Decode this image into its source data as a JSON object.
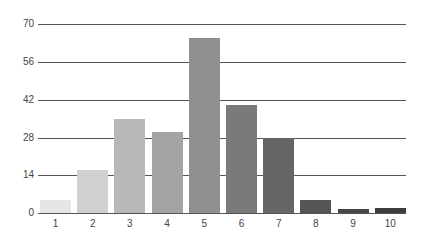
{
  "chart_data": {
    "type": "bar",
    "title": "",
    "xlabel": "",
    "ylabel": "",
    "categories": [
      "1",
      "2",
      "3",
      "4",
      "5",
      "6",
      "7",
      "8",
      "9",
      "10"
    ],
    "values": [
      5,
      16,
      35,
      30,
      65,
      40,
      28,
      5,
      1.5,
      2
    ],
    "colors": [
      "#e6e6e6",
      "#d0d0d0",
      "#b8b8b8",
      "#a3a3a3",
      "#8f8f8f",
      "#7a7a7a",
      "#666666",
      "#555555",
      "#474747",
      "#3d3d3d"
    ],
    "ylim": [
      0,
      70
    ],
    "yticks": [
      0,
      14,
      28,
      42,
      56,
      70
    ],
    "grid": true,
    "legend": null
  }
}
